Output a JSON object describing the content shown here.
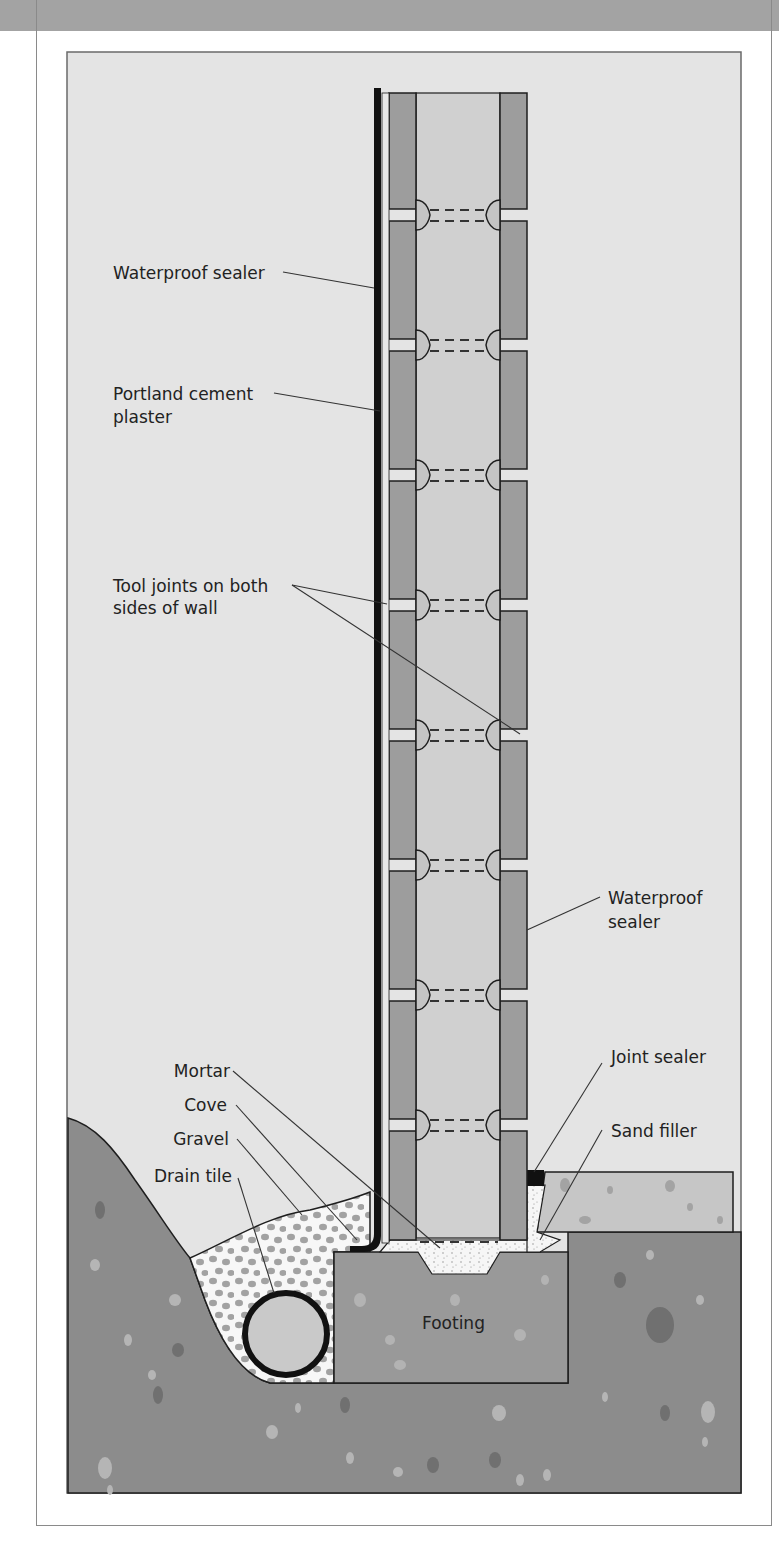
{
  "figure": {
    "type": "cross-section diagram"
  },
  "labels": {
    "waterproof_sealer_exterior": "Waterproof sealer",
    "portland_line1": "Portland cement",
    "portland_line2": "plaster",
    "tool_joints_line1": "Tool joints on both",
    "tool_joints_line2": "sides of wall",
    "waterproof_sealer_interior_line1": "Waterproof",
    "waterproof_sealer_interior_line2": "sealer",
    "mortar": "Mortar",
    "cove": "Cove",
    "gravel": "Gravel",
    "drain_tile": "Drain tile",
    "joint_sealer": "Joint sealer",
    "sand_filler": "Sand filler",
    "footing": "Footing"
  },
  "colors": {
    "background_air": "#e4e4e4",
    "block": "#9d9d9d",
    "block_core": "#d0d0d0",
    "soil": "#8c8c8c",
    "footing": "#999999",
    "slab": "#c6c6c6",
    "gravel_bg": "#f5f5f5",
    "gravel_dot": "#a0a0a0",
    "outline": "#1e1e1e",
    "header_band": "#a3a3a3"
  }
}
